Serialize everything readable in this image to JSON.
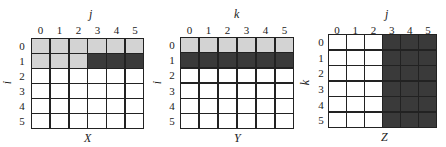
{
  "colors": {
    "white": "#ffffff",
    "light": "#d3d3d3",
    "dark": "#3a3a3a",
    "line": "#222222"
  },
  "panels": [
    {
      "name": "X",
      "row_axis": "i",
      "col_axis": "j",
      "col_ticks": [
        "0",
        "1",
        "2",
        "3",
        "4",
        "5"
      ],
      "row_ticks": [
        "0",
        "1",
        "2",
        "3",
        "4",
        "5"
      ],
      "cells": [
        [
          "l",
          "l",
          "l",
          "l",
          "l",
          "l"
        ],
        [
          "l",
          "l",
          "l",
          "d",
          "d",
          "d"
        ],
        [
          "w",
          "w",
          "w",
          "w",
          "w",
          "w"
        ],
        [
          "w",
          "w",
          "w",
          "w",
          "w",
          "w"
        ],
        [
          "w",
          "w",
          "w",
          "w",
          "w",
          "w"
        ],
        [
          "w",
          "w",
          "w",
          "w",
          "w",
          "w"
        ]
      ]
    },
    {
      "name": "Y",
      "row_axis": "i",
      "col_axis": "k",
      "col_ticks": [
        "0",
        "1",
        "2",
        "3",
        "4",
        "5"
      ],
      "row_ticks": [
        "0",
        "1",
        "2",
        "3",
        "4",
        "5"
      ],
      "cells": [
        [
          "l",
          "l",
          "l",
          "l",
          "l",
          "l"
        ],
        [
          "d",
          "d",
          "d",
          "d",
          "d",
          "d"
        ],
        [
          "w",
          "w",
          "w",
          "w",
          "w",
          "w"
        ],
        [
          "w",
          "w",
          "w",
          "w",
          "w",
          "w"
        ],
        [
          "w",
          "w",
          "w",
          "w",
          "w",
          "w"
        ],
        [
          "w",
          "w",
          "w",
          "w",
          "w",
          "w"
        ]
      ]
    },
    {
      "name": "Z",
      "row_axis": "k",
      "col_axis": "j",
      "col_ticks": [
        "0",
        "1",
        "2",
        "3",
        "4",
        "5"
      ],
      "row_ticks": [
        "0",
        "1",
        "2",
        "3",
        "4",
        "5"
      ],
      "cells": [
        [
          "w",
          "w",
          "w",
          "d",
          "d",
          "d"
        ],
        [
          "w",
          "w",
          "w",
          "d",
          "d",
          "d"
        ],
        [
          "w",
          "w",
          "w",
          "d",
          "d",
          "d"
        ],
        [
          "w",
          "w",
          "w",
          "d",
          "d",
          "d"
        ],
        [
          "w",
          "w",
          "w",
          "d",
          "d",
          "d"
        ],
        [
          "w",
          "w",
          "w",
          "d",
          "d",
          "d"
        ]
      ]
    }
  ],
  "legend": {
    "l": "light gray cell",
    "d": "dark gray cell",
    "w": "white cell"
  }
}
